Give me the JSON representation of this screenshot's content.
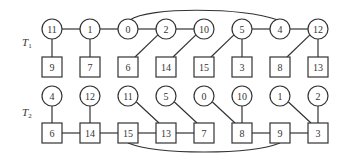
{
  "diagram": {
    "type": "two-tree-structure",
    "columns_x": [
      52,
      90,
      128,
      166,
      204,
      242,
      280,
      318
    ],
    "trees": [
      {
        "label": "T",
        "label_sub": "1",
        "label_pos": [
          22,
          46
        ],
        "circle_y": 29,
        "square_y": 67,
        "circles": [
          "11",
          "1",
          "0",
          "2",
          "10",
          "5",
          "4",
          "12"
        ],
        "squares": [
          "9",
          "7",
          "6",
          "14",
          "15",
          "3",
          "8",
          "13"
        ],
        "circle_chain_edges": [
          [
            0,
            1
          ],
          [
            1,
            2
          ],
          [
            2,
            3
          ],
          [
            3,
            4
          ],
          [
            5,
            6
          ],
          [
            6,
            7
          ]
        ],
        "square_chain_edges": [],
        "arc": {
          "from_circle": 2,
          "to_circle": 6,
          "side": "above"
        },
        "cross_edges": [
          {
            "circle": 0,
            "square": 0
          },
          {
            "circle": 1,
            "square": 1
          },
          {
            "circle": 3,
            "square": 2
          },
          {
            "circle": 4,
            "square": 3
          },
          {
            "circle": 5,
            "square": 4
          },
          {
            "circle": 5,
            "square": 5
          },
          {
            "circle": 7,
            "square": 6
          },
          {
            "circle": 7,
            "square": 7
          }
        ]
      },
      {
        "label": "T",
        "label_sub": "2",
        "label_pos": [
          22,
          116
        ],
        "circle_y": 96,
        "square_y": 133,
        "circles": [
          "4",
          "12",
          "11",
          "5",
          "0",
          "10",
          "1",
          "2"
        ],
        "squares": [
          "6",
          "14",
          "15",
          "13",
          "7",
          "8",
          "9",
          "3"
        ],
        "circle_chain_edges": [],
        "square_chain_edges": [
          [
            0,
            1
          ],
          [
            1,
            2
          ],
          [
            2,
            3
          ],
          [
            3,
            4
          ],
          [
            5,
            6
          ],
          [
            6,
            7
          ]
        ],
        "arc": {
          "from_square": 2,
          "to_square": 6,
          "side": "below"
        },
        "cross_edges": [
          {
            "circle": 0,
            "square": 0
          },
          {
            "circle": 1,
            "square": 1
          },
          {
            "circle": 2,
            "square": 3
          },
          {
            "circle": 3,
            "square": 4
          },
          {
            "circle": 4,
            "square": 5
          },
          {
            "circle": 5,
            "square": 5
          },
          {
            "circle": 6,
            "square": 7
          },
          {
            "circle": 7,
            "square": 7
          }
        ]
      }
    ],
    "style": {
      "stroke": "#333333",
      "fill": "#ffffff",
      "circle_radius": 10,
      "square_size": 20
    }
  }
}
